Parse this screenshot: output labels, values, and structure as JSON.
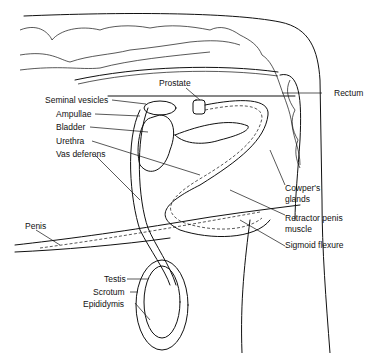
{
  "diagram": {
    "type": "anatomical illustration",
    "labels": {
      "prostate": "Prostate",
      "rectum": "Rectum",
      "seminal_vesicles": "Seminal vesicles",
      "ampullae": "Ampullae",
      "bladder": "Bladder",
      "urethra": "Urethra",
      "vas_deferens": "Vas deferens",
      "cowpers_glands_1": "Cowper's",
      "cowpers_glands_2": "glands",
      "retractor_1": "Retractor penis",
      "retractor_2": "muscle",
      "sigmoid_flexure": "Sigmoid flexure",
      "penis": "Penis",
      "testis": "Testis",
      "scrotum": "Scrotum",
      "epididymis": "Epididymis"
    },
    "colors": {
      "line": "#111111",
      "background": "#ffffff",
      "shade": "#9a9a9a"
    }
  }
}
